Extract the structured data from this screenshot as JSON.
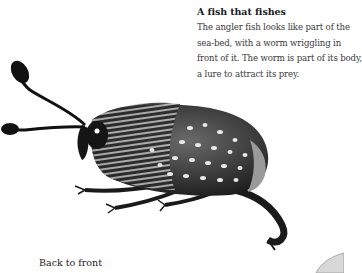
{
  "caption": {
    "title": "A fish that fishes",
    "lines": [
      "The angler fish looks like part of the",
      "sea-bed, with a worm wriggling in",
      "front of it. The worm is part of its body,",
      "a lure to attract its prey."
    ]
  },
  "sections": {
    "next_heading": "Back to front"
  },
  "illustration": {
    "subject": "beetle-illustration",
    "colors": {
      "body_dark": "#1b1b1b",
      "body_mid": "#5a5a5a",
      "stripe_light": "#bdbdbd",
      "spot": "#e8e8e8"
    }
  }
}
